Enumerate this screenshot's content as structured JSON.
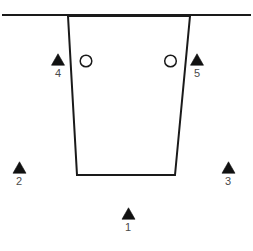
{
  "figure": {
    "kind": "cross-section-diagram",
    "background_color": "#ffffff",
    "stroke_color": "#1a1a1a",
    "label_color": "#4a4a4a",
    "marker_fill": "#111111",
    "circle_fill": "none",
    "width": 253,
    "height": 251
  },
  "ground_line": {
    "name": "ground-surface-line",
    "x1": 2,
    "y1": 15,
    "x2": 251,
    "y2": 15,
    "stroke_width": 2.2
  },
  "excavation": {
    "name": "trapezoid-excavation",
    "points": "68,16 190,16 175,175 77,175",
    "stroke_width": 2.0,
    "fill": "none"
  },
  "triangle_markers": [
    {
      "id": "marker-1",
      "label": "1",
      "cx": 128.5,
      "cy": 213.5,
      "size": 13,
      "label_x": 118,
      "label_y": 222
    },
    {
      "id": "marker-2",
      "label": "2",
      "cx": 19.5,
      "cy": 167.5,
      "size": 13,
      "label_x": 9,
      "label_y": 176
    },
    {
      "id": "marker-3",
      "label": "3",
      "cx": 228.5,
      "cy": 167.5,
      "size": 13,
      "label_x": 218,
      "label_y": 176
    },
    {
      "id": "marker-4",
      "label": "4",
      "cx": 58.0,
      "cy": 59.5,
      "size": 13,
      "label_x": 48,
      "label_y": 68
    },
    {
      "id": "marker-5",
      "label": "5",
      "cx": 197.0,
      "cy": 59.5,
      "size": 13,
      "label_x": 187,
      "label_y": 68
    }
  ],
  "circle_markers": [
    {
      "id": "circle-left",
      "cx": 86.0,
      "cy": 61.0,
      "r": 5.8,
      "stroke_width": 1.5
    },
    {
      "id": "circle-right",
      "cx": 170.5,
      "cy": 61.0,
      "r": 5.8,
      "stroke_width": 1.5
    }
  ]
}
